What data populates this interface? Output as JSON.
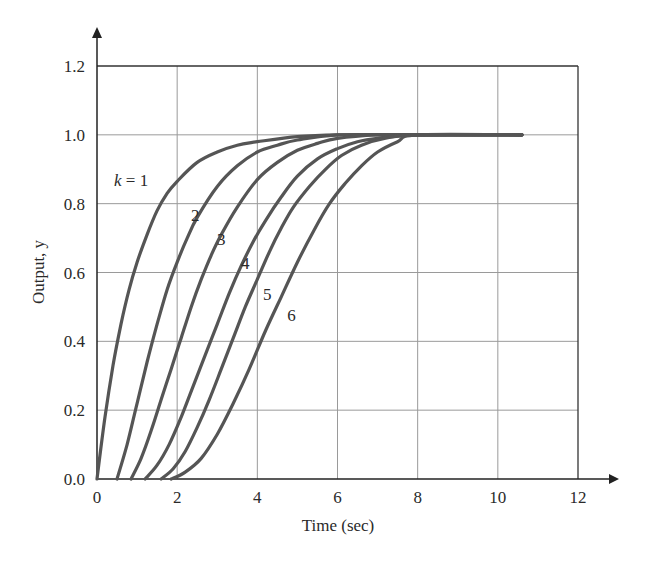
{
  "chart_data": {
    "type": "line",
    "title": "",
    "xlabel": "Time (sec)",
    "ylabel": "Output, y",
    "xlim": [
      0,
      12
    ],
    "ylim": [
      0,
      1.2
    ],
    "xticks": [
      "0",
      "2",
      "4",
      "6",
      "8",
      "10",
      "12"
    ],
    "yticks": [
      "0.0",
      "0.2",
      "0.4",
      "0.6",
      "0.8",
      "1.0",
      "1.2"
    ],
    "grid": true,
    "legend": "inline curve labels",
    "line_color": "#555555",
    "series": [
      {
        "name": "k = 1",
        "label": "k = 1",
        "x": [
          0,
          0.2,
          0.4,
          0.6,
          0.8,
          1.0,
          1.25,
          1.5,
          1.75,
          2.0,
          2.5,
          3.0,
          3.5,
          4.0,
          5.0,
          6.0,
          8.0,
          10.6
        ],
        "y": [
          0,
          0.18,
          0.33,
          0.45,
          0.55,
          0.63,
          0.71,
          0.78,
          0.83,
          0.865,
          0.92,
          0.95,
          0.97,
          0.98,
          0.995,
          1.0,
          1.0,
          1.0
        ]
      },
      {
        "name": "k = 2",
        "label": "2",
        "x": [
          0.5,
          0.75,
          1.0,
          1.25,
          1.5,
          1.75,
          2.0,
          2.25,
          2.5,
          3.0,
          3.5,
          4.0,
          4.5,
          5.0,
          6.0,
          8.0,
          10.6
        ],
        "y": [
          0,
          0.1,
          0.22,
          0.34,
          0.45,
          0.55,
          0.63,
          0.7,
          0.76,
          0.85,
          0.91,
          0.95,
          0.97,
          0.985,
          1.0,
          1.0,
          1.0
        ]
      },
      {
        "name": "k = 3",
        "label": "3",
        "x": [
          0.85,
          1.1,
          1.35,
          1.6,
          1.85,
          2.1,
          2.35,
          2.6,
          2.85,
          3.1,
          3.5,
          4.0,
          4.5,
          5.0,
          5.5,
          6.0,
          7.0,
          8.0,
          10.6
        ],
        "y": [
          0,
          0.06,
          0.14,
          0.23,
          0.32,
          0.41,
          0.5,
          0.58,
          0.65,
          0.71,
          0.79,
          0.87,
          0.92,
          0.955,
          0.975,
          0.99,
          1.0,
          1.0,
          1.0
        ]
      },
      {
        "name": "k = 4",
        "label": "4",
        "x": [
          1.2,
          1.5,
          1.8,
          2.1,
          2.4,
          2.7,
          3.0,
          3.3,
          3.6,
          3.9,
          4.2,
          4.6,
          5.0,
          5.5,
          6.0,
          6.5,
          7.0,
          8.0,
          10.6
        ],
        "y": [
          0,
          0.04,
          0.1,
          0.18,
          0.27,
          0.36,
          0.45,
          0.54,
          0.62,
          0.69,
          0.75,
          0.82,
          0.88,
          0.93,
          0.96,
          0.98,
          0.99,
          1.0,
          1.0
        ]
      },
      {
        "name": "k = 5",
        "label": "5",
        "x": [
          1.6,
          1.9,
          2.2,
          2.5,
          2.8,
          3.1,
          3.4,
          3.7,
          4.0,
          4.3,
          4.6,
          4.9,
          5.3,
          5.7,
          6.1,
          6.6,
          7.2,
          8.0,
          10.6
        ],
        "y": [
          0,
          0.03,
          0.08,
          0.15,
          0.23,
          0.32,
          0.41,
          0.5,
          0.58,
          0.66,
          0.73,
          0.79,
          0.85,
          0.9,
          0.94,
          0.97,
          0.99,
          1.0,
          1.0
        ]
      },
      {
        "name": "k = 6",
        "label": "6",
        "x": [
          1.85,
          2.2,
          2.6,
          3.0,
          3.4,
          3.8,
          4.2,
          4.6,
          5.0,
          5.4,
          5.8,
          6.2,
          6.6,
          7.0,
          7.5,
          8.0,
          10.6
        ],
        "y": [
          0,
          0.02,
          0.06,
          0.13,
          0.22,
          0.32,
          0.43,
          0.53,
          0.63,
          0.72,
          0.8,
          0.86,
          0.91,
          0.95,
          0.98,
          1.0,
          1.0
        ]
      }
    ],
    "annotations": [
      {
        "text": "k = 1",
        "x": 0.85,
        "y": 0.85
      },
      {
        "text": "2",
        "x": 2.45,
        "y": 0.75
      },
      {
        "text": "3",
        "x": 3.1,
        "y": 0.68
      },
      {
        "text": "4",
        "x": 3.7,
        "y": 0.61
      },
      {
        "text": "5",
        "x": 4.25,
        "y": 0.52
      },
      {
        "text": "6",
        "x": 4.85,
        "y": 0.46
      }
    ]
  }
}
